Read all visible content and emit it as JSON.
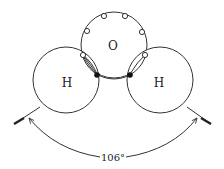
{
  "diagram": {
    "atoms": {
      "oxygen": {
        "label": "O"
      },
      "hydrogen_left": {
        "label": "H"
      },
      "hydrogen_right": {
        "label": "H"
      }
    },
    "angle_label": "106°",
    "colors": {
      "stroke": "#333333",
      "background": "#ffffff",
      "shared_electron": "#111111"
    }
  }
}
